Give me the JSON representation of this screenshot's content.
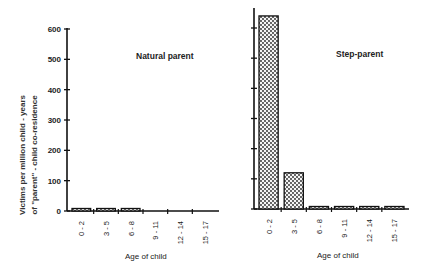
{
  "chart_data": [
    {
      "type": "bar",
      "title": "Natural parent",
      "xlabel": "Age of child",
      "ylabel": "Victims per million child - years of \"parent\" - child co-residence",
      "categories": [
        "0 - 2",
        "3 - 5",
        "6 - 8",
        "9 - 11",
        "12 - 14",
        "15 - 17"
      ],
      "values": [
        8,
        5,
        4,
        0,
        0,
        0
      ],
      "yticks": [
        0,
        100,
        200,
        300,
        400,
        500,
        600
      ],
      "ylim": [
        0,
        600
      ],
      "grid": false,
      "fill_pattern": "stippled"
    },
    {
      "type": "bar",
      "title": "Step-parent",
      "xlabel": "Age of child",
      "ylabel": "",
      "categories": [
        "0 - 2",
        "3 - 5",
        "6 - 8",
        "9 - 11",
        "12 - 14",
        "15 - 17"
      ],
      "values": [
        640,
        120,
        8,
        6,
        6,
        7
      ],
      "yticks": [
        0,
        100,
        200,
        300,
        400,
        500,
        600
      ],
      "ylim": [
        0,
        600
      ],
      "grid": false,
      "fill_pattern": "stippled"
    }
  ],
  "labels": {
    "ylabel_line1": "Victims per million child - years",
    "ylabel_line2": "of \"parent\" - child co-residence",
    "left_title": "Natural parent",
    "right_title": "Step-parent",
    "xlabel_left": "Age of child",
    "xlabel_right": "Age of child",
    "yticks": [
      "0",
      "100",
      "200",
      "300",
      "400",
      "500",
      "600"
    ],
    "categories": [
      "0 - 2",
      "3 - 5",
      "6 - 8",
      "9 - 11",
      "12 - 14",
      "15 - 17"
    ]
  }
}
